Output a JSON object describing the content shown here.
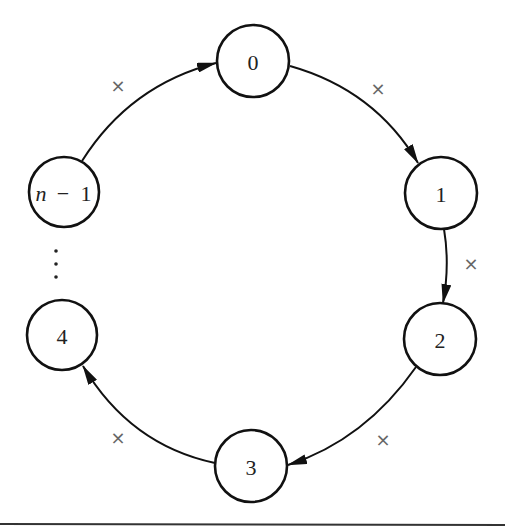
{
  "diagram": {
    "type": "ring",
    "nodes": [
      {
        "id": "0",
        "label": "0",
        "cx": 253,
        "cy": 61,
        "r": 36
      },
      {
        "id": "1",
        "label": "1",
        "cx": 441,
        "cy": 193,
        "r": 36
      },
      {
        "id": "2",
        "label": "2",
        "cx": 440,
        "cy": 339,
        "r": 36
      },
      {
        "id": "3",
        "label": "3",
        "cx": 251,
        "cy": 466,
        "r": 36
      },
      {
        "id": "4",
        "label": "4",
        "cx": 62,
        "cy": 335,
        "r": 35
      },
      {
        "id": "n-1",
        "label_var": "n",
        "label_op": "−",
        "label_num": "1",
        "cx": 64,
        "cy": 192,
        "r": 35
      }
    ],
    "edges": [
      {
        "from": "n-1",
        "to": "0",
        "mark": "×"
      },
      {
        "from": "0",
        "to": "1",
        "mark": "×"
      },
      {
        "from": "1",
        "to": "2",
        "mark": "×"
      },
      {
        "from": "2",
        "to": "3",
        "mark": "×"
      },
      {
        "from": "3",
        "to": "4",
        "mark": "×"
      }
    ],
    "ellipsis": "⋮",
    "colors": {
      "stroke": "#111111",
      "mark": "#666666",
      "background": "#ffffff"
    }
  }
}
